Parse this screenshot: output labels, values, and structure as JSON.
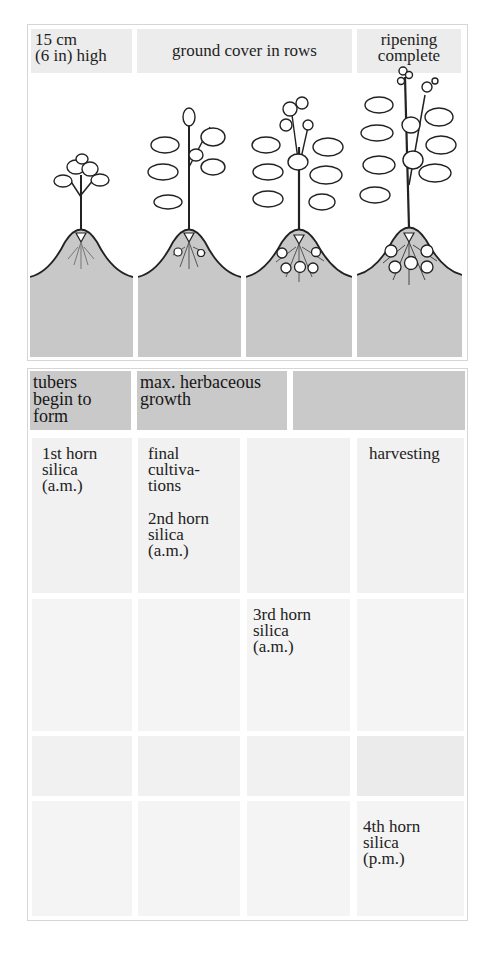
{
  "diagram": {
    "title_cropped": "",
    "stage_labels": [
      {
        "id": "stage-1",
        "line1": "15 cm",
        "line2": "(6 in) high"
      },
      {
        "id": "stage-2-3",
        "text": "ground cover in rows"
      },
      {
        "id": "stage-4",
        "line1": "ripening",
        "line2": "complete"
      }
    ],
    "plant_illustrations": [
      {
        "stage": 1,
        "description": "young potato plant on earthed-up ridge, roots only"
      },
      {
        "stage": 2,
        "description": "larger plant, small tubers starting"
      },
      {
        "stage": 3,
        "description": "flowering plant, several tubers"
      },
      {
        "stage": 4,
        "description": "tall mature plant with berries, full tubers"
      }
    ],
    "phase_headers": [
      {
        "col": 1,
        "line1": "tubers",
        "line2": "begin to",
        "line3": "form"
      },
      {
        "col": 2,
        "line1": "max. herbaceous",
        "line2": "growth"
      },
      {
        "col": "3-4",
        "text": ""
      }
    ],
    "tasks": {
      "col1": {
        "line1": "1st horn",
        "line2": "silica",
        "line3": "(a.m.)"
      },
      "col2a": {
        "line1": "final",
        "line2": "cultiva-",
        "line3": "tions"
      },
      "col2b": {
        "line1": "2nd horn",
        "line2": "silica",
        "line3": "(a.m.)"
      },
      "col3": {
        "line1": "3rd horn",
        "line2": "silica",
        "line3": "(a.m.)"
      },
      "col4a": {
        "text": "harvesting"
      },
      "col4b": {
        "line1": "4th horn",
        "line2": "silica",
        "line3": "(p.m.)"
      }
    },
    "colors": {
      "label_bg": "#ececec",
      "header_bg": "#c9c9c9",
      "cell_bg": "#f1f1f1",
      "soil": "#c8c8c8",
      "ink": "#1e1e1e"
    }
  }
}
